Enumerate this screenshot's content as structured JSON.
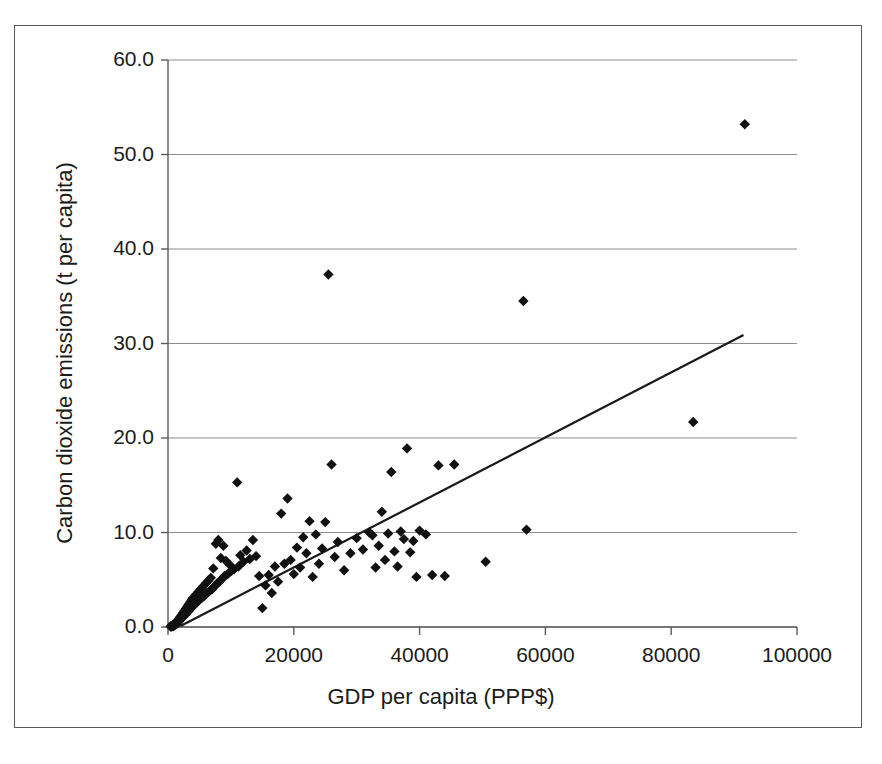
{
  "chart_data": {
    "type": "scatter",
    "title": "",
    "xlabel": "GDP per capita  (PPP$)",
    "ylabel": "Carbon dioxide emissions (t per capita)",
    "xlim": [
      0,
      100000
    ],
    "ylim": [
      0,
      60
    ],
    "xticks": [
      "0",
      "20000",
      "40000",
      "60000",
      "80000",
      "100000"
    ],
    "xtick_values": [
      0,
      20000,
      40000,
      60000,
      80000,
      100000
    ],
    "yticks": [
      "0.0",
      "10.0",
      "20.0",
      "30.0",
      "40.0",
      "50.0",
      "60.0"
    ],
    "ytick_values": [
      0,
      10,
      20,
      30,
      40,
      50,
      60
    ],
    "grid": "horizontal",
    "legend": "none",
    "marker": "diamond",
    "marker_color": "#111111",
    "trendline": {
      "type": "linear",
      "color": "#1a1a1a",
      "x_start": 2000,
      "y_start": 0.1,
      "x_end": 91500,
      "y_end": 30.9
    },
    "series": [
      {
        "name": "Countries",
        "points": [
          [
            400,
            0.05
          ],
          [
            500,
            0.1
          ],
          [
            600,
            0.05
          ],
          [
            700,
            0.15
          ],
          [
            750,
            0.1
          ],
          [
            800,
            0.2
          ],
          [
            850,
            0.1
          ],
          [
            900,
            0.25
          ],
          [
            950,
            0.15
          ],
          [
            1000,
            0.3
          ],
          [
            1050,
            0.2
          ],
          [
            1100,
            0.35
          ],
          [
            1150,
            0.25
          ],
          [
            1200,
            0.4
          ],
          [
            1250,
            0.3
          ],
          [
            1300,
            0.45
          ],
          [
            1350,
            0.35
          ],
          [
            1400,
            0.5
          ],
          [
            1450,
            0.4
          ],
          [
            1500,
            0.6
          ],
          [
            1550,
            0.45
          ],
          [
            1600,
            0.7
          ],
          [
            1650,
            0.5
          ],
          [
            1700,
            0.8
          ],
          [
            1750,
            0.6
          ],
          [
            1800,
            0.9
          ],
          [
            1850,
            0.7
          ],
          [
            1900,
            1.0
          ],
          [
            1950,
            0.8
          ],
          [
            2000,
            1.1
          ],
          [
            2100,
            0.9
          ],
          [
            2200,
            1.3
          ],
          [
            2300,
            1.0
          ],
          [
            2400,
            1.5
          ],
          [
            2500,
            1.2
          ],
          [
            2600,
            1.7
          ],
          [
            2700,
            1.3
          ],
          [
            2800,
            1.9
          ],
          [
            2900,
            1.4
          ],
          [
            3000,
            2.1
          ],
          [
            3100,
            1.6
          ],
          [
            3200,
            2.3
          ],
          [
            3300,
            1.7
          ],
          [
            3400,
            2.5
          ],
          [
            3500,
            1.9
          ],
          [
            3600,
            2.7
          ],
          [
            3700,
            2.0
          ],
          [
            3800,
            2.9
          ],
          [
            3900,
            2.2
          ],
          [
            4000,
            3.1
          ],
          [
            4200,
            2.4
          ],
          [
            4400,
            3.4
          ],
          [
            4600,
            2.6
          ],
          [
            4800,
            3.7
          ],
          [
            5000,
            2.9
          ],
          [
            5200,
            4.0
          ],
          [
            5400,
            3.1
          ],
          [
            5600,
            4.3
          ],
          [
            5800,
            3.3
          ],
          [
            6000,
            4.6
          ],
          [
            6200,
            3.6
          ],
          [
            6400,
            4.9
          ],
          [
            6600,
            3.8
          ],
          [
            6800,
            5.2
          ],
          [
            7000,
            4.0
          ],
          [
            7200,
            6.2
          ],
          [
            7400,
            4.3
          ],
          [
            7600,
            8.8
          ],
          [
            7800,
            4.6
          ],
          [
            8000,
            9.2
          ],
          [
            8200,
            4.8
          ],
          [
            8400,
            7.3
          ],
          [
            8600,
            5.1
          ],
          [
            8800,
            8.6
          ],
          [
            9000,
            5.4
          ],
          [
            9200,
            7.0
          ],
          [
            9500,
            5.6
          ],
          [
            9800,
            6.6
          ],
          [
            10000,
            5.9
          ],
          [
            10500,
            6.1
          ],
          [
            11000,
            15.3
          ],
          [
            11200,
            6.4
          ],
          [
            11500,
            7.6
          ],
          [
            12000,
            6.9
          ],
          [
            12500,
            8.1
          ],
          [
            13000,
            7.2
          ],
          [
            13500,
            9.2
          ],
          [
            14000,
            7.5
          ],
          [
            14500,
            5.4
          ],
          [
            15000,
            2.0
          ],
          [
            15500,
            4.4
          ],
          [
            16000,
            5.5
          ],
          [
            16500,
            3.6
          ],
          [
            17000,
            6.4
          ],
          [
            17500,
            4.8
          ],
          [
            18000,
            12.0
          ],
          [
            18500,
            6.7
          ],
          [
            19000,
            13.6
          ],
          [
            19500,
            7.1
          ],
          [
            20000,
            5.6
          ],
          [
            20500,
            8.4
          ],
          [
            21000,
            6.3
          ],
          [
            21500,
            9.5
          ],
          [
            22000,
            7.8
          ],
          [
            22500,
            11.2
          ],
          [
            23000,
            5.3
          ],
          [
            23500,
            9.8
          ],
          [
            24000,
            6.7
          ],
          [
            24500,
            8.3
          ],
          [
            25000,
            11.1
          ],
          [
            25500,
            37.3
          ],
          [
            26000,
            17.2
          ],
          [
            26500,
            7.4
          ],
          [
            27000,
            9.0
          ],
          [
            28000,
            6.0
          ],
          [
            29000,
            7.8
          ],
          [
            30000,
            9.4
          ],
          [
            31000,
            8.2
          ],
          [
            32000,
            10.0
          ],
          [
            32500,
            9.7
          ],
          [
            33000,
            6.3
          ],
          [
            33500,
            8.6
          ],
          [
            34000,
            12.2
          ],
          [
            34500,
            7.1
          ],
          [
            35000,
            9.9
          ],
          [
            35500,
            16.4
          ],
          [
            36000,
            8.0
          ],
          [
            36500,
            6.4
          ],
          [
            37000,
            10.1
          ],
          [
            37500,
            9.3
          ],
          [
            38000,
            18.9
          ],
          [
            38500,
            7.9
          ],
          [
            39000,
            9.1
          ],
          [
            39500,
            5.3
          ],
          [
            40000,
            10.2
          ],
          [
            41000,
            9.8
          ],
          [
            42000,
            5.5
          ],
          [
            43000,
            17.1
          ],
          [
            44000,
            5.4
          ],
          [
            45500,
            17.2
          ],
          [
            50500,
            6.9
          ],
          [
            56500,
            34.5
          ],
          [
            57000,
            10.3
          ],
          [
            83500,
            21.7
          ],
          [
            91700,
            53.2
          ]
        ]
      }
    ]
  }
}
